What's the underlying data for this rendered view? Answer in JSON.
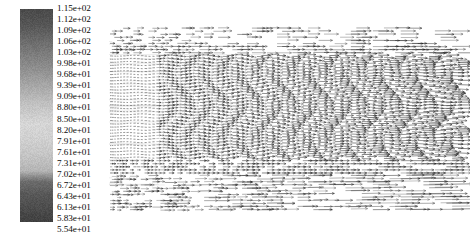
{
  "figure": {
    "kind": "vector-field-quiver-plot-with-grayscale-colorbar",
    "width": 470,
    "height": 239,
    "background": "#ffffff"
  },
  "colorbar": {
    "name": "grayscale-colorbar",
    "orientation": "vertical",
    "x": 20,
    "y": 9,
    "width": 33,
    "height": 213,
    "value_max": "1.15e+02",
    "value_min": "5.54e+01",
    "stops": [
      {
        "pos": 0.0,
        "color": "#4a4a4a"
      },
      {
        "pos": 0.07,
        "color": "#555555"
      },
      {
        "pos": 0.16,
        "color": "#6e6e6e"
      },
      {
        "pos": 0.27,
        "color": "#8c8c8c"
      },
      {
        "pos": 0.37,
        "color": "#aaaaaa"
      },
      {
        "pos": 0.46,
        "color": "#c4c4c4"
      },
      {
        "pos": 0.54,
        "color": "#d6d6d6"
      },
      {
        "pos": 0.62,
        "color": "#cfcfcf"
      },
      {
        "pos": 0.7,
        "color": "#c2c2c2"
      },
      {
        "pos": 0.76,
        "color": "#b4b4b4"
      },
      {
        "pos": 0.81,
        "color": "#6d6d6d"
      },
      {
        "pos": 0.87,
        "color": "#585858"
      },
      {
        "pos": 1.0,
        "color": "#404040"
      }
    ],
    "ticks": [
      "1.15e+02",
      "1.12e+02",
      "1.09e+02",
      "1.06e+02",
      "1.03e+02",
      "9.98e+01",
      "9.68e+01",
      "9.39e+01",
      "9.09e+01",
      "8.80e+01",
      "8.50e+01",
      "8.20e+01",
      "7.91e+01",
      "7.61e+01",
      "7.31e+01",
      "7.02e+01",
      "6.72e+01",
      "6.43e+01",
      "6.13e+01",
      "5.83e+01",
      "5.54e+01"
    ],
    "tick_values": [
      115.0,
      112.0,
      109.0,
      106.0,
      103.0,
      99.8,
      96.8,
      93.9,
      90.9,
      88.0,
      85.0,
      82.0,
      79.1,
      76.1,
      73.1,
      70.2,
      67.2,
      64.3,
      61.3,
      58.3,
      55.4
    ],
    "tick_label_start_y": 1,
    "tick_label_spacing": 11.05
  },
  "plot": {
    "name": "vector-field-plot",
    "x": 108,
    "y": 26,
    "width": 362,
    "height": 190,
    "arrow_color": "#1d1d1d",
    "description": "dense quiver field of rightward arrows forming growing sinusoidal wave fronts"
  },
  "chart_data": {
    "type": "scatter",
    "title": "",
    "xlabel": "",
    "ylabel": "",
    "grid": false,
    "legend_position": "left",
    "colormap": "grayscale",
    "colorbar_ticks": [
      "1.15e+02",
      "1.12e+02",
      "1.09e+02",
      "1.06e+02",
      "1.03e+02",
      "9.98e+01",
      "9.68e+01",
      "9.39e+01",
      "9.09e+01",
      "8.80e+01",
      "8.50e+01",
      "8.20e+01",
      "7.91e+01",
      "7.61e+01",
      "7.31e+01",
      "7.02e+01",
      "6.72e+01",
      "6.43e+01",
      "6.13e+01",
      "5.83e+01",
      "5.54e+01"
    ],
    "value_range": [
      55.4,
      115.0
    ],
    "field": {
      "rows": 60,
      "cols": 74,
      "primary_direction": "+x",
      "wave_region": {
        "y_fraction": [
          0.15,
          0.72
        ],
        "wavelength_px": 34,
        "amplitude_growth": "increases left to right",
        "amplitude_px_start": 1.5,
        "amplitude_px_end": 13
      },
      "sparse_top_rows": 4,
      "sparse_bottom_rows": 12
    }
  }
}
